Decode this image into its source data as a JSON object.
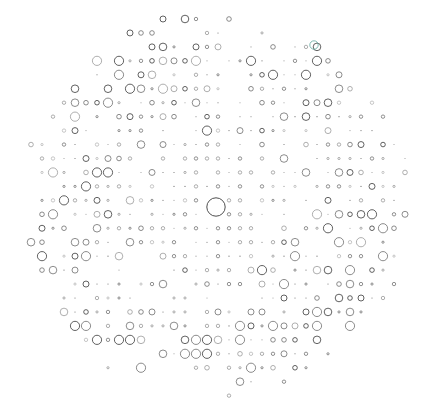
{
  "artwork": {
    "title": "Circle Grid Field",
    "type": "generative-dot-grid",
    "canvas": {
      "width": 425,
      "height": 414,
      "background": "#ffffff"
    },
    "grid": {
      "origin_x": 20.0,
      "origin_y": 19.0,
      "step_x": 11.0,
      "step_y": 13.95,
      "cols": 37,
      "rows": 28
    },
    "mask": {
      "shape": "ellipse",
      "center_x": 216.0,
      "center_y": 207.0,
      "radius_x": 200.0,
      "radius_y": 195.0
    },
    "palette": {
      "ink": "#3a3a3a",
      "ink_light": "#6e6e6e",
      "ink_faint": "#9a9a9a",
      "accent_teal": "#5fa8a0",
      "background": "#ffffff"
    },
    "focal_point": {
      "label": "center-large-circle",
      "cx": 216.0,
      "cy": 207.0,
      "r": 9.2,
      "stroke": "#3a3a3a",
      "stroke_width": 0.9
    },
    "accent_marks": [
      {
        "label": "teal-ring-upper-right",
        "cx": 314.0,
        "cy": 45.0,
        "r": 4.2,
        "stroke": "#5fa8a0"
      }
    ],
    "size_scale": {
      "levels": [
        0.6,
        1.1,
        1.7,
        2.3,
        3.0,
        3.8,
        4.6
      ],
      "stroke_width_small": 0.55,
      "stroke_width_large": 0.8
    },
    "seed": 20240131,
    "description": "An elliptical field of open circles on a regular grid, radii varying pseudo-randomly, with one oversized ring marking the centre."
  }
}
